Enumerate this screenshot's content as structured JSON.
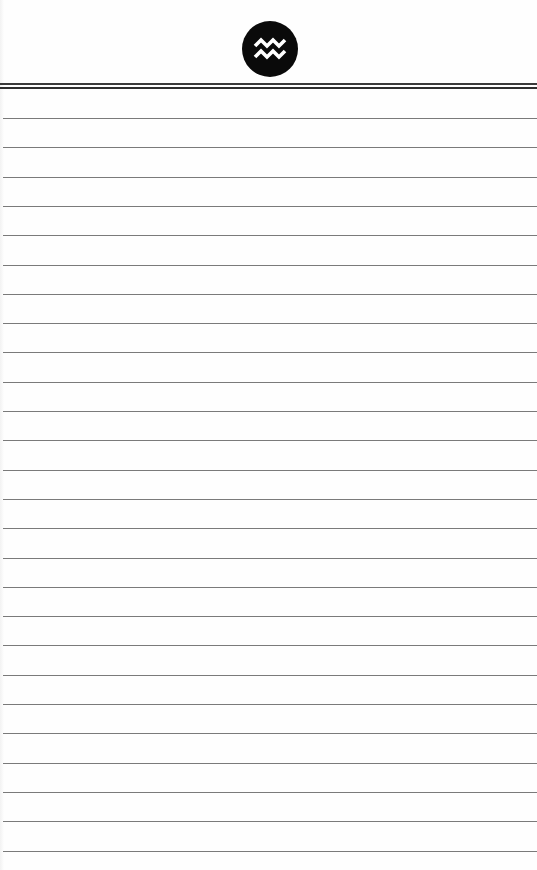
{
  "page": {
    "type": "lined-notepad",
    "emblem": {
      "icon": "aquarius-icon",
      "shape": "circle",
      "background_color": "#0a0a0a",
      "glyph_color": "#ffffff"
    },
    "header_rule": {
      "style": "double",
      "color": "#333333"
    },
    "ruled_lines": {
      "count": 26,
      "first_y": 118,
      "spacing": 29.3,
      "color": "#7a7a7a"
    }
  }
}
